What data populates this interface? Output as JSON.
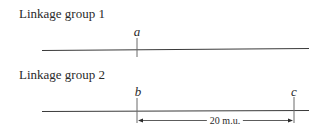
{
  "groups": [
    {
      "label": "Linkage group 1",
      "loci": [
        {
          "name": "a"
        }
      ]
    },
    {
      "label": "Linkage group 2",
      "loci": [
        {
          "name": "b"
        },
        {
          "name": "c"
        }
      ],
      "distance": {
        "from": "b",
        "to": "c",
        "label": "20 m.u."
      }
    }
  ],
  "colors": {
    "line": "#3a3a3a",
    "text": "#2a2a2a"
  }
}
